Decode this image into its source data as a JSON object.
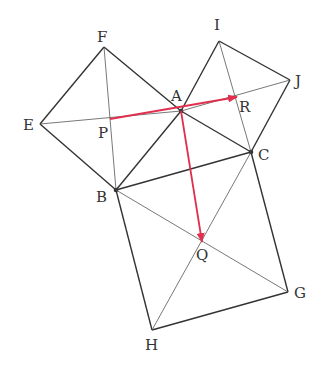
{
  "diagram": {
    "colors": {
      "line": "#333333",
      "thin": "#555555",
      "vector": "#e0304e"
    },
    "points": {
      "A": [
        181,
        111
      ],
      "B": [
        116,
        190
      ],
      "C": [
        251,
        152
      ],
      "E": [
        40,
        124
      ],
      "F": [
        104,
        47
      ],
      "I": [
        219,
        41
      ],
      "J": [
        290,
        80
      ],
      "G": [
        288,
        292
      ],
      "H": [
        152,
        330
      ],
      "P": [
        110,
        119
      ],
      "Q": [
        202,
        242
      ],
      "R": [
        237,
        97
      ]
    },
    "labels": [
      {
        "text": "F",
        "x": 97,
        "y": 42
      },
      {
        "text": "I",
        "x": 214,
        "y": 30
      },
      {
        "text": "J",
        "x": 295,
        "y": 86
      },
      {
        "text": "E",
        "x": 23,
        "y": 130
      },
      {
        "text": "A",
        "x": 171,
        "y": 101
      },
      {
        "text": "P",
        "x": 98,
        "y": 138
      },
      {
        "text": "R",
        "x": 239,
        "y": 112
      },
      {
        "text": "C",
        "x": 258,
        "y": 160
      },
      {
        "text": "B",
        "x": 96,
        "y": 202
      },
      {
        "text": "Q",
        "x": 196,
        "y": 260
      },
      {
        "text": "G",
        "x": 294,
        "y": 298
      },
      {
        "text": "H",
        "x": 145,
        "y": 350
      }
    ],
    "vectors": [
      {
        "name": "PR",
        "from": "P",
        "to": "R"
      },
      {
        "name": "AQ",
        "from": "A",
        "to": "Q"
      }
    ]
  }
}
